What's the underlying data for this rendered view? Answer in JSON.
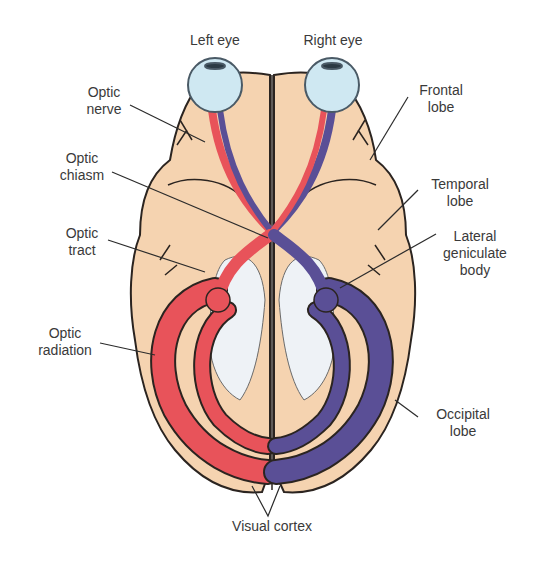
{
  "colors": {
    "brain": "#f5d3b0",
    "outline": "#2b2420",
    "left_field_red": "#e8535a",
    "right_field_blue": "#5a4f96",
    "ventricle_white": "#eef2f6",
    "eye": "#cfe8f2",
    "label_text": "#3a3a3a",
    "leader_line": "#2b2b2b"
  },
  "labels": {
    "left_eye": "Left eye",
    "right_eye": "Right eye",
    "optic_nerve": "Optic\nnerve",
    "optic_chiasm": "Optic\nchiasm",
    "optic_tract": "Optic\ntract",
    "optic_radiation": "Optic\nradiation",
    "frontal_lobe": "Frontal\nlobe",
    "temporal_lobe": "Temporal\nlobe",
    "lateral_geniculate_body": "Lateral\ngeniculate\nbody",
    "occipital_lobe": "Occipital\nlobe",
    "visual_cortex": "Visual cortex"
  }
}
